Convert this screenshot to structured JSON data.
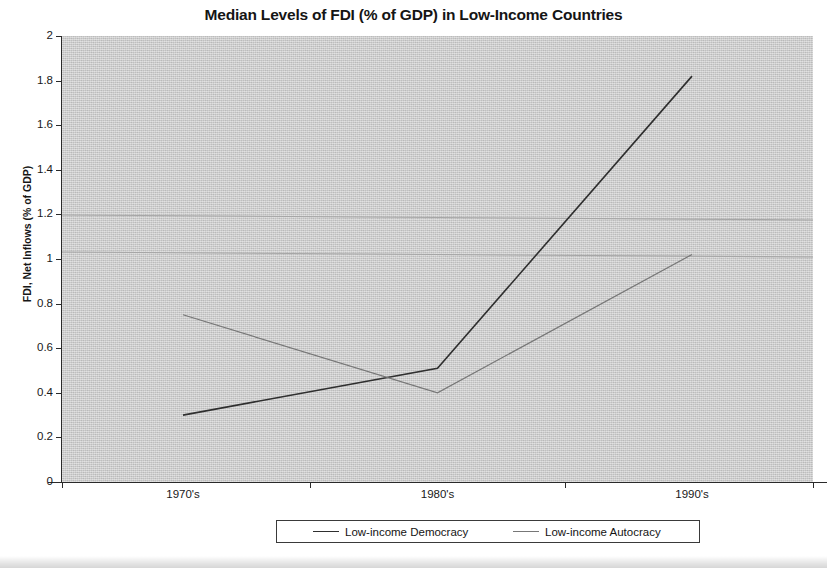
{
  "chart_data": {
    "type": "line",
    "title": "Median Levels of FDI (% of GDP) in Low-Income Countries",
    "xlabel": "",
    "ylabel": "FDI, Net Inflows (% of GDP)",
    "categories": [
      "1970's",
      "1980's",
      "1990's"
    ],
    "ylim": [
      0,
      2
    ],
    "y_ticks": [
      "0",
      "0.2",
      "0.4",
      "0.6",
      "0.8",
      "1",
      "1.2",
      "1.4",
      "1.6",
      "1.8",
      "2"
    ],
    "y_tick_values": [
      0,
      0.2,
      0.4,
      0.6,
      0.8,
      1.0,
      1.2,
      1.4,
      1.6,
      1.8,
      2.0
    ],
    "grid": false,
    "legend_position": "bottom",
    "series": [
      {
        "name": "Low-income Democracy",
        "values": [
          0.3,
          0.51,
          1.82
        ],
        "color": "#2f2f2f"
      },
      {
        "name": "Low-income Autocracy",
        "values": [
          0.75,
          0.4,
          1.02
        ],
        "color": "#777777"
      }
    ],
    "annotations": []
  },
  "legend": {
    "entries": [
      {
        "label": "Low-income Democracy",
        "color": "#2f2f2f"
      },
      {
        "label": "Low-income Autocracy",
        "color": "#777777"
      }
    ]
  }
}
